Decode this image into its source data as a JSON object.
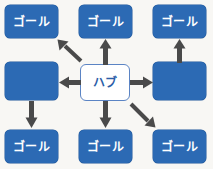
{
  "diagram": {
    "colors": {
      "node_blue": "#2c6ab4",
      "node_border": "#1f5699",
      "hub_fill": "#ffffff",
      "hub_border": "#5b84c4",
      "hub_text": "#2c5ea8",
      "goal_text": "#ffffff",
      "arrow": "#4a4a4a",
      "background": "#f8f7f4"
    },
    "hub": {
      "label": "ハブ",
      "x": 80,
      "y": 64,
      "w": 50,
      "h": 37
    },
    "goals": [
      {
        "id": "goal-top-left",
        "label": "ゴール",
        "x": 5,
        "y": 5,
        "w": 53,
        "h": 33
      },
      {
        "id": "goal-top-center",
        "label": "ゴール",
        "x": 79,
        "y": 5,
        "w": 53,
        "h": 33
      },
      {
        "id": "goal-top-right",
        "label": "ゴール",
        "x": 153,
        "y": 5,
        "w": 53,
        "h": 33
      },
      {
        "id": "goal-bottom-left",
        "label": "ゴール",
        "x": 5,
        "y": 130,
        "w": 53,
        "h": 33
      },
      {
        "id": "goal-bottom-center",
        "label": "ゴール",
        "x": 79,
        "y": 130,
        "w": 53,
        "h": 33
      },
      {
        "id": "goal-bottom-right",
        "label": "ゴール",
        "x": 153,
        "y": 130,
        "w": 53,
        "h": 33
      }
    ],
    "relays": [
      {
        "id": "relay-left",
        "label": "",
        "x": 5,
        "y": 62,
        "w": 53,
        "h": 38
      },
      {
        "id": "relay-right",
        "label": "",
        "x": 153,
        "y": 62,
        "w": 53,
        "h": 38
      }
    ],
    "arrows": [
      {
        "id": "arrow-hub-to-top-left",
        "direction": "up-left",
        "from": "ハブ",
        "to": "ゴール"
      },
      {
        "id": "arrow-hub-to-top-center",
        "direction": "up",
        "from": "ハブ",
        "to": "ゴール"
      },
      {
        "id": "arrow-hub-to-left-relay",
        "direction": "left",
        "from": "ハブ",
        "to": ""
      },
      {
        "id": "arrow-hub-to-right-relay",
        "direction": "right",
        "from": "ハブ",
        "to": ""
      },
      {
        "id": "arrow-hub-to-bottom-center",
        "direction": "down",
        "from": "ハブ",
        "to": "ゴール"
      },
      {
        "id": "arrow-hub-to-bottom-right",
        "direction": "down-right",
        "from": "ハブ",
        "to": "ゴール"
      },
      {
        "id": "arrow-left-relay-to-bottom-left",
        "direction": "down",
        "from": "",
        "to": "ゴール"
      },
      {
        "id": "arrow-right-relay-to-top-right",
        "direction": "up",
        "from": "",
        "to": "ゴール"
      }
    ]
  }
}
